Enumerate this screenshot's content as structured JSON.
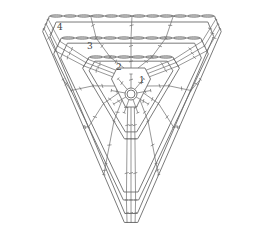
{
  "diagram": {
    "type": "crochet-chart",
    "line_color": "#6b6b6b",
    "background": "#ffffff",
    "center_ring": {
      "cx": 131,
      "cy": 94,
      "r": 6
    },
    "rounds": [
      {
        "number": "1",
        "label_pos": [
          139,
          81
        ]
      },
      {
        "number": "2",
        "label_pos": [
          116,
          68
        ]
      },
      {
        "number": "3",
        "label_pos": [
          87,
          47
        ]
      },
      {
        "number": "4",
        "label_pos": [
          57,
          28
        ]
      }
    ],
    "legend_symbols": [
      "chain (oval)",
      "double crochet (T with slash)",
      "slip stitch",
      "magic ring"
    ]
  }
}
